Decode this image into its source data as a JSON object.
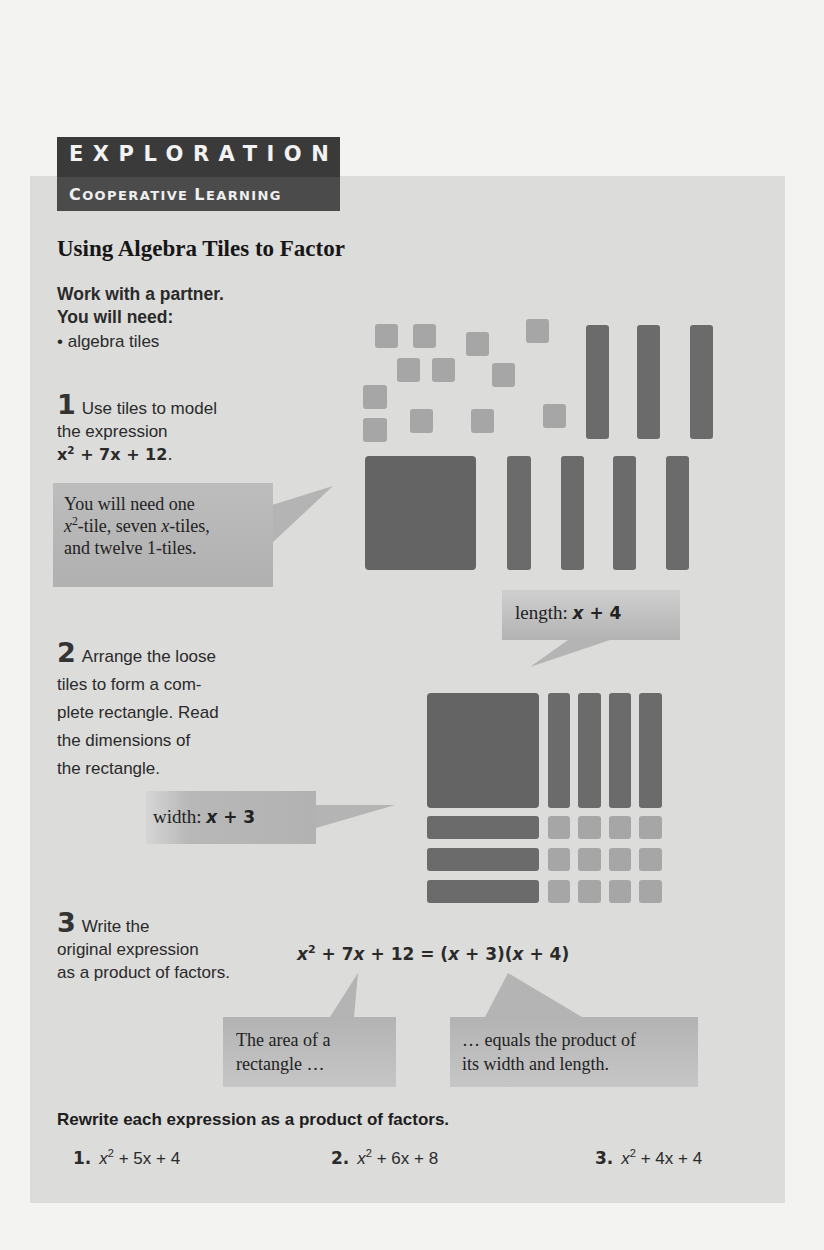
{
  "header": {
    "label": "EXPLORATION",
    "sublabel_caps": [
      "C",
      "OOPERATIVE ",
      "L",
      "EARNING"
    ],
    "sublabel": "Cooperative Learning"
  },
  "title": "Using Algebra Tiles to Factor",
  "intro": {
    "line1": "Work with a partner.",
    "line2": "You will need:",
    "materials": [
      "• algebra tiles"
    ]
  },
  "step1": {
    "number": "1",
    "text_line1": "Use tiles to model",
    "text_line2": "the expression",
    "expression": {
      "base": "x",
      "exp": "2",
      "rest": " + 7x + 12",
      "end": "."
    },
    "callout": {
      "line1": "You will need one",
      "line2_sup_base": "x",
      "line2_sup": "2",
      "line2_a": "-tile, seven ",
      "line2_var": "x",
      "line2_b": "-tiles,",
      "line3": "and twelve 1-tiles."
    }
  },
  "step2": {
    "number": "2",
    "lines": [
      "Arrange the loose",
      "tiles to form a com-",
      "plete rectangle. Read",
      "the dimensions of",
      "the rectangle."
    ],
    "width_callout": {
      "label": "width: ",
      "var": "x",
      "rest": " + 3"
    },
    "length_callout": {
      "label": "length: ",
      "var": "x",
      "rest": " + 4"
    }
  },
  "step3": {
    "number": "3",
    "lines": [
      "Write the",
      "original expression",
      "as a product of factors."
    ],
    "equation": {
      "lhs_base": "x",
      "lhs_exp": "2",
      "lhs_rest": " + 7",
      "lhs_var": "x",
      "lhs_end": " + 12 = (",
      "f1_var": "x",
      "f1_rest": " + 3)(",
      "f2_var": "x",
      "f2_rest": " + 4)"
    },
    "callout_left": [
      "The area of a",
      "rectangle …"
    ],
    "callout_right": [
      "… equals the product of",
      "its width and length."
    ]
  },
  "exercises": {
    "instruction": "Rewrite each expression as a product of factors.",
    "items": [
      {
        "n": "1.",
        "base": "x",
        "exp": "2",
        "rest": " + 5x + 4"
      },
      {
        "n": "2.",
        "base": "x",
        "exp": "2",
        "rest": " + 6x + 8"
      },
      {
        "n": "3.",
        "base": "x",
        "exp": "2",
        "rest": " + 4x + 4"
      }
    ]
  },
  "colors": {
    "page_bg": "#f3f3f2",
    "panel_bg": "#dcdcdb",
    "header_bg": "#3e3e3e",
    "x2_tile": "#646464",
    "x_tile": "#6b6b6b",
    "unit_tile": "#a6a6a6",
    "callout_bg": "#b5b5b5"
  },
  "tiles": {
    "loose_units": [
      [
        375,
        324
      ],
      [
        413,
        324
      ],
      [
        466,
        332
      ],
      [
        526,
        319
      ],
      [
        397,
        358
      ],
      [
        432,
        358
      ],
      [
        492,
        363
      ],
      [
        363,
        385
      ],
      [
        363,
        418
      ],
      [
        410,
        409
      ],
      [
        471,
        409
      ],
      [
        543,
        404
      ]
    ],
    "loose_x_top": [
      586,
      637,
      690
    ],
    "loose_x_bottom": [
      507,
      561,
      613,
      666
    ],
    "arranged_cols": [
      548,
      578,
      609,
      639
    ],
    "arranged_rows": [
      816,
      848,
      880
    ]
  }
}
